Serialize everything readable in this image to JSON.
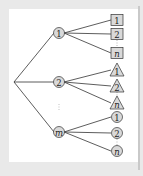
{
  "diagram": {
    "type": "tree",
    "colors": {
      "background": "#e9e9e9",
      "panel": "#ffffff",
      "node_fill": "#d9d9d9",
      "stroke": "#333333"
    },
    "root": {
      "x": 14,
      "y": 82
    },
    "branches": [
      {
        "label": "1",
        "italic": false,
        "x": 59,
        "y": 33,
        "leaf_shape": "square",
        "leaves": [
          {
            "label": "1",
            "italic": false,
            "y": 20
          },
          {
            "label": "2",
            "italic": false,
            "y": 34
          },
          {
            "label": "n",
            "italic": true,
            "y": 53
          }
        ]
      },
      {
        "label": "2",
        "italic": false,
        "x": 59,
        "y": 82,
        "leaf_shape": "triangle",
        "leaves": [
          {
            "label": "1",
            "italic": false,
            "y": 70
          },
          {
            "label": "2",
            "italic": false,
            "y": 86
          },
          {
            "label": "n",
            "italic": true,
            "y": 103
          }
        ]
      },
      {
        "label": "m",
        "italic": true,
        "x": 59,
        "y": 132,
        "leaf_shape": "circle",
        "leaves": [
          {
            "label": "1",
            "italic": false,
            "y": 117
          },
          {
            "label": "2",
            "italic": false,
            "y": 133
          },
          {
            "label": "n",
            "italic": true,
            "y": 151
          }
        ]
      }
    ],
    "leaf_x": 117,
    "ellipsis": {
      "label": "⋮",
      "x": 59,
      "y": 107
    }
  }
}
